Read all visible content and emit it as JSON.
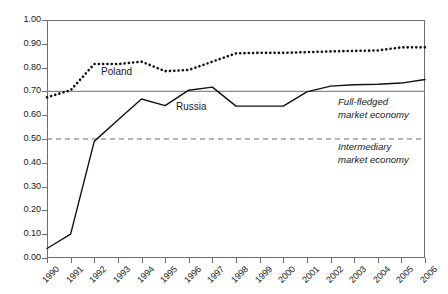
{
  "chart_data": {
    "type": "line",
    "title": "",
    "xlabel": "",
    "ylabel": "",
    "xlim": [
      1990,
      2006
    ],
    "ylim": [
      0.0,
      1.0
    ],
    "grid": false,
    "legend_position": "inline-labels",
    "categories": [
      1990,
      1991,
      1992,
      1993,
      1994,
      1995,
      1996,
      1997,
      1998,
      1999,
      2000,
      2001,
      2002,
      2003,
      2004,
      2005,
      2006
    ],
    "x_tick_labels": [
      "1990",
      "1991",
      "1992",
      "1993",
      "1994",
      "1995",
      "1996",
      "1997",
      "1998",
      "1999",
      "2000",
      "2001",
      "2002",
      "2003",
      "2004",
      "2005",
      "2006"
    ],
    "y_tick_labels": [
      "1.00",
      "0.90",
      "0.80",
      "0.70",
      "0.60",
      "0.50",
      "0.40",
      "0.30",
      "0.20",
      "0.10",
      "0.00"
    ],
    "y_tick_values": [
      1.0,
      0.9,
      0.8,
      0.7,
      0.6,
      0.5,
      0.4,
      0.3,
      0.2,
      0.1,
      0.0
    ],
    "series": [
      {
        "name": "Poland",
        "style": "dotted",
        "color": "#111111",
        "values": [
          0.675,
          0.705,
          0.815,
          0.815,
          0.825,
          0.785,
          0.79,
          0.825,
          0.86,
          0.862,
          0.862,
          0.865,
          0.868,
          0.87,
          0.872,
          0.885,
          0.885
        ]
      },
      {
        "name": "Russia",
        "style": "solid",
        "color": "#111111",
        "values": [
          0.04,
          0.1,
          0.49,
          0.58,
          0.668,
          0.64,
          0.705,
          0.718,
          0.638,
          0.638,
          0.638,
          0.698,
          0.722,
          0.728,
          0.73,
          0.735,
          0.75
        ]
      }
    ],
    "reference_lines": [
      {
        "name": "full-fledged-threshold",
        "value": 0.7,
        "style": "solid",
        "color": "#8a8a8a"
      },
      {
        "name": "intermediary-threshold",
        "value": 0.5,
        "style": "dashed",
        "color": "#6f6f6f"
      }
    ],
    "annotations": [
      {
        "name": "full-fledged-zone",
        "line1": "Full-fledged",
        "line2": "market economy"
      },
      {
        "name": "intermediary-zone",
        "line1": "Intermediary",
        "line2": "market economy"
      }
    ]
  },
  "labels": {
    "poland": "Poland",
    "russia": "Russia",
    "full_fledged_line1": "Full-fledged",
    "full_fledged_line2": "market economy",
    "intermediary_line1": "Intermediary",
    "intermediary_line2": "market economy"
  }
}
